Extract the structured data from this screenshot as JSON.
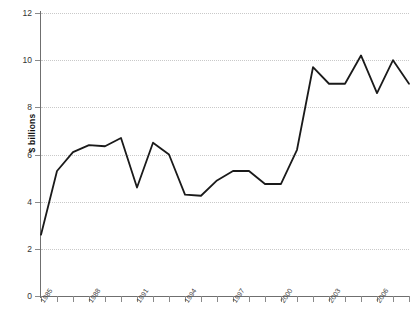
{
  "chart_data": {
    "type": "line",
    "title": "",
    "xlabel": "",
    "ylabel": "$ billions",
    "ylim": [
      0,
      12
    ],
    "yticks": [
      0,
      2,
      4,
      6,
      8,
      10,
      12
    ],
    "ytick_labels": [
      "0",
      "2",
      "4",
      "6",
      "8",
      "10",
      "12"
    ],
    "grid": true,
    "legend": "none",
    "xlim": [
      1985,
      2008
    ],
    "xtick_labels": [
      "1985",
      "1988",
      "1991",
      "1994",
      "1997",
      "2000",
      "2003",
      "2006"
    ],
    "xtick_values": [
      1985,
      1988,
      1991,
      1994,
      1997,
      2000,
      2003,
      2006
    ],
    "x": [
      1985,
      1986,
      1987,
      1988,
      1989,
      1990,
      1991,
      1992,
      1993,
      1994,
      1995,
      1996,
      1997,
      1998,
      1999,
      2000,
      2001,
      2002,
      2003,
      2004,
      2005,
      2006,
      2007,
      2008
    ],
    "values": [
      2.6,
      5.3,
      6.1,
      6.4,
      6.35,
      6.7,
      4.6,
      6.5,
      6.0,
      4.3,
      4.25,
      4.9,
      5.3,
      5.3,
      4.75,
      4.75,
      6.2,
      9.7,
      9.0,
      9.0,
      10.2,
      8.6,
      10.0,
      9.0
    ],
    "series": [
      {
        "name": "series-1",
        "color": "#1a1a1a",
        "values": [
          2.6,
          5.3,
          6.1,
          6.4,
          6.35,
          6.7,
          4.6,
          6.5,
          6.0,
          4.3,
          4.25,
          4.9,
          5.3,
          5.3,
          4.75,
          4.75,
          6.2,
          9.7,
          9.0,
          9.0,
          10.2,
          8.6,
          10.0,
          9.0
        ]
      }
    ]
  },
  "style": {
    "line_color": "#1a1a1a",
    "axis_color": "#6f6f6f",
    "grid_color": "#c9c9c9",
    "background": "#ffffff"
  }
}
